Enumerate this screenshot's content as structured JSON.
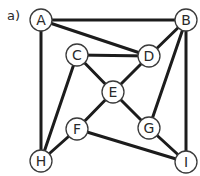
{
  "diagram": {
    "part_label": "a)",
    "type": "undirected-graph",
    "colors": {
      "edge": "#1c1c1c",
      "node_stroke": "#3a3a3a",
      "node_fill": "#ffffff",
      "text": "#2a2a2a"
    },
    "node_radius": 11,
    "nodes": [
      {
        "id": "A",
        "label": "A",
        "x": 41,
        "y": 20
      },
      {
        "id": "B",
        "label": "B",
        "x": 186,
        "y": 20
      },
      {
        "id": "C",
        "label": "C",
        "x": 77,
        "y": 55
      },
      {
        "id": "D",
        "label": "D",
        "x": 149,
        "y": 56
      },
      {
        "id": "E",
        "label": "E",
        "x": 113,
        "y": 92
      },
      {
        "id": "F",
        "label": "F",
        "x": 77,
        "y": 129
      },
      {
        "id": "G",
        "label": "G",
        "x": 149,
        "y": 128
      },
      {
        "id": "H",
        "label": "H",
        "x": 41,
        "y": 161
      },
      {
        "id": "I",
        "label": "I",
        "x": 186,
        "y": 162
      }
    ],
    "edges": [
      [
        "A",
        "B"
      ],
      [
        "A",
        "D"
      ],
      [
        "A",
        "H"
      ],
      [
        "B",
        "D"
      ],
      [
        "B",
        "G"
      ],
      [
        "B",
        "I"
      ],
      [
        "C",
        "D"
      ],
      [
        "C",
        "E"
      ],
      [
        "C",
        "H"
      ],
      [
        "D",
        "E"
      ],
      [
        "E",
        "F"
      ],
      [
        "E",
        "G"
      ],
      [
        "F",
        "H"
      ],
      [
        "F",
        "I"
      ],
      [
        "G",
        "I"
      ]
    ]
  }
}
